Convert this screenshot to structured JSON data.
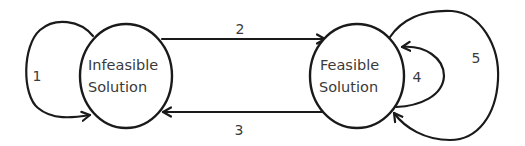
{
  "diagram": {
    "type": "state-transition",
    "colors": {
      "stroke": "#1a1a1a",
      "text": "#3a3a3a",
      "background": "#ffffff"
    },
    "nodes": [
      {
        "id": "infeasible",
        "line1": "Infeasible",
        "line2": "Solution"
      },
      {
        "id": "feasible",
        "line1": "Feasible",
        "line2": "Solution"
      }
    ],
    "edges": [
      {
        "id": "1",
        "label": "1",
        "from": "infeasible",
        "to": "infeasible",
        "kind": "self-loop"
      },
      {
        "id": "2",
        "label": "2",
        "from": "infeasible",
        "to": "feasible",
        "kind": "straight"
      },
      {
        "id": "3",
        "label": "3",
        "from": "feasible",
        "to": "infeasible",
        "kind": "straight"
      },
      {
        "id": "4",
        "label": "4",
        "from": "feasible",
        "to": "feasible",
        "kind": "self-loop-inner"
      },
      {
        "id": "5",
        "label": "5",
        "from": "feasible",
        "to": "feasible",
        "kind": "self-loop-outer"
      }
    ]
  }
}
